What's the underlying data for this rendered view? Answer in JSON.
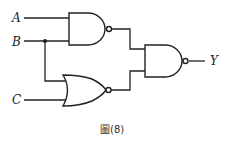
{
  "diagram": {
    "type": "logic-circuit",
    "inputs": [
      "A",
      "B",
      "C"
    ],
    "output": "Y",
    "gates": [
      {
        "id": "g1",
        "type": "NAND",
        "inputs": [
          "A",
          "B"
        ]
      },
      {
        "id": "g2",
        "type": "NOR",
        "inputs": [
          "B",
          "C"
        ]
      },
      {
        "id": "g3",
        "type": "NAND",
        "inputs": [
          "g1",
          "g2"
        ],
        "output": "Y"
      }
    ],
    "labels": {
      "a": "A",
      "b": "B",
      "c": "C",
      "y": "Y"
    },
    "caption": "圖(8)"
  }
}
